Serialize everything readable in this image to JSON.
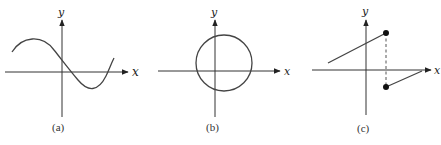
{
  "figure": {
    "panels": [
      {
        "id": "a",
        "caption": "(a)",
        "x_label": "x",
        "y_label": "y",
        "description": "Smooth curve (cubic-like) crossing y-axis once and x-axis twice",
        "axes": {
          "origin": [
            62,
            72
          ],
          "x_range": [
            5,
            128
          ],
          "y_range": [
            20,
            117
          ]
        },
        "curve_path": "M12,52 C22,36 42,34 54,50 C62,60 68,68 78,80 C88,92 98,92 106,76 C109,70 111,64 114,58"
      },
      {
        "id": "b",
        "caption": "(b)",
        "x_label": "x",
        "y_label": "y",
        "description": "Circle intersecting both axes",
        "axes": {
          "origin": [
            215,
            71
          ],
          "x_range": [
            158,
            280
          ],
          "y_range": [
            20,
            117
          ]
        },
        "circle": {
          "cx": 224,
          "cy": 63,
          "r": 28
        }
      },
      {
        "id": "c",
        "caption": "(c)",
        "x_label": "x",
        "y_label": "y",
        "description": "Piecewise linear function with jump discontinuity; filled endpoints joined by a dashed vertical line",
        "axes": {
          "origin": [
            366,
            70
          ],
          "x_range": [
            312,
            431
          ],
          "y_range": [
            20,
            115
          ]
        },
        "segments": [
          {
            "from": [
              328,
              63
            ],
            "to": [
              386,
              33
            ]
          },
          {
            "from": [
              386,
              87
            ],
            "to": [
              422,
              71
            ]
          }
        ],
        "points": [
          [
            386,
            33
          ],
          [
            386,
            87
          ]
        ],
        "dashed": {
          "from": [
            386,
            33
          ],
          "to": [
            386,
            87
          ]
        }
      }
    ]
  },
  "colors": {
    "stroke": "#333333",
    "background": "#ffffff"
  }
}
